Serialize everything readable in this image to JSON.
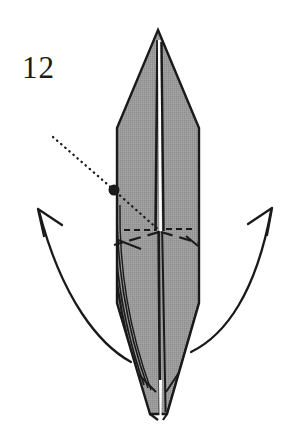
{
  "figure": {
    "kind": "origami-step-diagram",
    "step_number": "12",
    "background_color": "#ffffff",
    "paper_fill_color": "#9a9a9a",
    "ink_color": "#1a1a1a"
  },
  "labels": {
    "step_number": "12"
  },
  "shapes": {
    "paper_body": {
      "name": "folded-paper-body",
      "description": "tall narrow pointed origami form",
      "apex": [
        158,
        30
      ],
      "outline_points": "158,30 198,128 198,305 166,415 158,415 150,415 117,305 117,128",
      "fill": "#9a9a9a",
      "stroke": "#1a1a1a"
    },
    "center_slit": {
      "name": "center-slit",
      "top": [
        158,
        40
      ],
      "bottom": [
        160,
        232
      ],
      "fill": "#ffffff"
    },
    "reference_dot": {
      "name": "reference-dot",
      "center": [
        114,
        190
      ],
      "radius": 5.5,
      "fill": "#1a1a1a"
    }
  },
  "lines": {
    "dotted_projection": {
      "name": "dotted-projection-line",
      "start": [
        53,
        137
      ],
      "via": [
        114,
        190
      ],
      "end": [
        160,
        231
      ],
      "style": "dotted"
    },
    "dashed_horizontal_crease": {
      "name": "dashed-horizontal-crease",
      "left_start": [
        124,
        230
      ],
      "left_end": [
        155,
        230
      ],
      "right_start": [
        165,
        229
      ],
      "right_end": [
        196,
        229
      ],
      "style": "dashed"
    },
    "dashed_v_crease": {
      "name": "dashed-v-crease",
      "left_start": [
        160,
        232
      ],
      "left_end": [
        114,
        245
      ],
      "right_start": [
        160,
        232
      ],
      "right_end": [
        199,
        243
      ],
      "style": "dashed"
    }
  },
  "arrows": [
    {
      "name": "left-unfold-arrow",
      "direction": "up-left",
      "tail": [
        131,
        362
      ],
      "control": [
        60,
        330
      ],
      "tip": [
        38,
        210
      ],
      "head_wing_a": [
        55,
        232
      ],
      "head_wing_b": [
        61,
        205
      ]
    },
    {
      "name": "right-unfold-arrow",
      "direction": "up-right",
      "tail": [
        191,
        352
      ],
      "control": [
        250,
        320
      ],
      "tip": [
        272,
        209
      ],
      "head_wing_a": [
        248,
        230
      ],
      "head_wing_b": [
        252,
        203
      ]
    }
  ],
  "layer_edges": {
    "name": "left-layer-edge-lines",
    "count": 4,
    "description": "stacked paper layer edges along left side"
  }
}
